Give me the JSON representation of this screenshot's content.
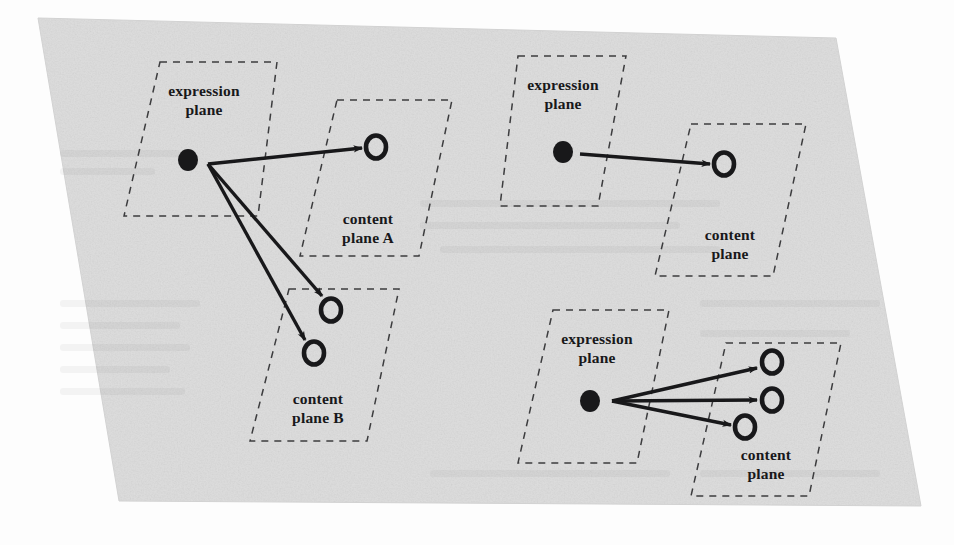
{
  "figure": {
    "background_color": "#dcdcdc",
    "page_color": "#fdfdfd",
    "ink_color": "#18181a",
    "dash_color": "#3c3c3e"
  },
  "diagrams": [
    {
      "id": "top-left",
      "name": "one-expression-to-many-contents-two-planes",
      "planes": [
        {
          "id": "tl-expression",
          "role": "expression",
          "label_line1": "expression",
          "label_line2": "plane",
          "label_x": 204,
          "label_y": 96,
          "points": "160,62 277,62 258,216 124,216"
        },
        {
          "id": "tl-content-a",
          "role": "content",
          "label_line1": "content",
          "label_line2": "plane A",
          "label_x": 368,
          "label_y": 224,
          "points": "337,100 452,100 419,256 300,256"
        },
        {
          "id": "tl-content-b",
          "role": "content",
          "label_line1": "content",
          "label_line2": "plane B",
          "label_x": 318,
          "label_y": 404,
          "points": "289,289 399,289 367,441 250,441"
        }
      ],
      "source_node": {
        "id": "tl-sign",
        "cx": 188,
        "cy": 160,
        "rx": 10,
        "ry": 11,
        "filled": true
      },
      "origin": {
        "x": 208,
        "y": 164
      },
      "target_nodes": [
        {
          "id": "tl-target-1",
          "cx": 376,
          "cy": 147,
          "rx": 10,
          "ry": 11.5,
          "filled": false
        },
        {
          "id": "tl-target-2",
          "cx": 331,
          "cy": 310,
          "rx": 10,
          "ry": 11.5,
          "filled": false
        },
        {
          "id": "tl-target-3",
          "cx": 314,
          "cy": 353,
          "rx": 10,
          "ry": 11.5,
          "filled": false
        }
      ],
      "arrows": [
        {
          "id": "tl-arrow-1",
          "x1": 208,
          "y1": 164,
          "x2": 362,
          "y2": 148
        },
        {
          "id": "tl-arrow-2",
          "x1": 208,
          "y1": 164,
          "x2": 322,
          "y2": 296
        },
        {
          "id": "tl-arrow-3",
          "x1": 208,
          "y1": 164,
          "x2": 305,
          "y2": 340
        }
      ]
    },
    {
      "id": "top-right",
      "name": "one-expression-to-one-content",
      "planes": [
        {
          "id": "tr-expression",
          "role": "expression",
          "label_line1": "expression",
          "label_line2": "plane",
          "label_x": 563,
          "label_y": 90,
          "points": "518,56 626,56 598,206 500,206"
        },
        {
          "id": "tr-content",
          "role": "content",
          "label_line1": "content",
          "label_line2": "plane",
          "label_x": 730,
          "label_y": 240,
          "points": "691,124 806,124 773,276 655,276"
        }
      ],
      "source_node": {
        "id": "tr-sign",
        "cx": 563,
        "cy": 152,
        "rx": 10,
        "ry": 11,
        "filled": true
      },
      "origin": {
        "x": 580,
        "y": 154
      },
      "target_nodes": [
        {
          "id": "tr-target-1",
          "cx": 724,
          "cy": 164,
          "rx": 10,
          "ry": 11.5,
          "filled": false
        }
      ],
      "arrows": [
        {
          "id": "tr-arrow-1",
          "x1": 580,
          "y1": 154,
          "x2": 710,
          "y2": 164
        }
      ]
    },
    {
      "id": "bottom-right",
      "name": "one-expression-to-many-contents-one-plane",
      "planes": [
        {
          "id": "br-expression",
          "role": "expression",
          "label_line1": "expression",
          "label_line2": "plane",
          "label_x": 597,
          "label_y": 344,
          "points": "553,310 669,310 637,463 518,463"
        },
        {
          "id": "br-content",
          "role": "content",
          "label_line1": "content",
          "label_line2": "plane",
          "label_x": 766,
          "label_y": 460,
          "points": "726,343 841,343 809,496 691,496"
        }
      ],
      "source_node": {
        "id": "br-sign",
        "cx": 590,
        "cy": 401,
        "rx": 10,
        "ry": 11,
        "filled": true
      },
      "origin": {
        "x": 612,
        "y": 401
      },
      "target_nodes": [
        {
          "id": "br-target-1",
          "cx": 772,
          "cy": 362,
          "rx": 10,
          "ry": 11.5,
          "filled": false
        },
        {
          "id": "br-target-2",
          "cx": 772,
          "cy": 400,
          "rx": 10,
          "ry": 11.5,
          "filled": false
        },
        {
          "id": "br-target-3",
          "cx": 745,
          "cy": 427,
          "rx": 10,
          "ry": 11.5,
          "filled": false
        }
      ],
      "arrows": [
        {
          "id": "br-arrow-1",
          "x1": 612,
          "y1": 401,
          "x2": 757,
          "y2": 368
        },
        {
          "id": "br-arrow-2",
          "x1": 612,
          "y1": 401,
          "x2": 757,
          "y2": 400
        },
        {
          "id": "br-arrow-3",
          "x1": 612,
          "y1": 401,
          "x2": 731,
          "y2": 425
        }
      ]
    }
  ]
}
